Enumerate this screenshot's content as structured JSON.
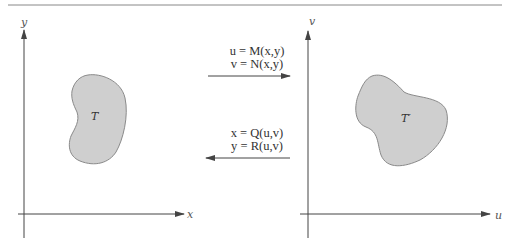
{
  "diagram": {
    "type": "coordinate-transformation",
    "colors": {
      "region_fill": "#cfcfcf",
      "region_stroke": "#8a8a8a",
      "axis": "#444444",
      "rule": "#888888"
    },
    "left_panel": {
      "x_axis_label": "x",
      "y_axis_label": "y",
      "region_label": "T"
    },
    "right_panel": {
      "x_axis_label": "u",
      "y_axis_label": "v",
      "region_label": "T′"
    },
    "forward_map": {
      "direction": "left-to-right",
      "eq1": "u = M(x,y)",
      "eq2": "v = N(x,y)"
    },
    "inverse_map": {
      "direction": "right-to-left",
      "eq1": "x = Q(u,v)",
      "eq2": "y = R(u,v)"
    }
  }
}
